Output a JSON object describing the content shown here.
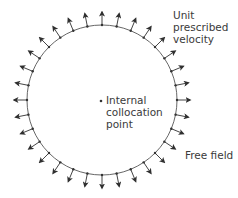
{
  "diagram": {
    "circle": {
      "cx": 102,
      "cy": 100,
      "r": 75,
      "stroke": "#555555",
      "point_count": 32,
      "arrow_length": 13,
      "arrow_color": "#2f2f2f"
    },
    "internal_point": {
      "x": 101,
      "y": 101
    },
    "labels": {
      "prescribed_velocity": [
        "Unit",
        "prescribed",
        "velocity"
      ],
      "internal_point": [
        "Internal",
        "collocation",
        "point"
      ],
      "free_field": "Free field"
    },
    "bullet": "•"
  }
}
